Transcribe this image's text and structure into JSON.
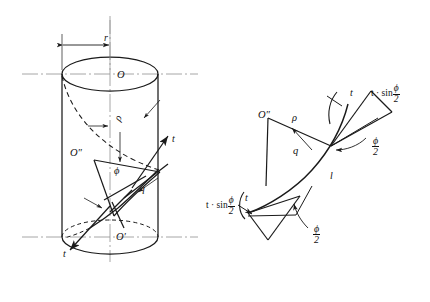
{
  "figure": {
    "stroke_color": "#1a1a1a",
    "axis_color": "#8a8a8a",
    "background": "#ffffff"
  },
  "left_diagram": {
    "name": "cylinder-helix-view",
    "labels": {
      "radius": "r",
      "top_center": "O",
      "bottom_center": "O′",
      "curvature_center": "O″",
      "rho": "ρ",
      "phi": "ϕ",
      "tangent_upper": "t",
      "tangent_lower": "t",
      "chord": "l"
    }
  },
  "right_diagram": {
    "name": "curvature-detail-view",
    "labels": {
      "curvature_center": "O″",
      "rho": "ρ",
      "q": "q",
      "arc_length": "l",
      "tangent_upper": "t",
      "tangent_lower": "t",
      "component_upper_prefix": "t · sin",
      "component_lower_prefix": "t · sin",
      "component_num": "ϕ",
      "component_den": "2",
      "angle_upper_num": "ϕ",
      "angle_upper_den": "2",
      "angle_lower_num": "ϕ",
      "angle_lower_den": "2"
    }
  }
}
